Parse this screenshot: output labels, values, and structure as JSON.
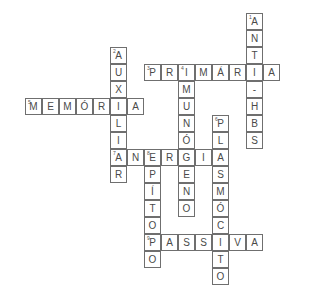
{
  "puzzle": {
    "type": "crossword",
    "cell_size_px": 17,
    "origin_px": [
      25,
      13
    ],
    "colors": {
      "border": "#6f6f6f",
      "letter": "#4a4a4a",
      "background": "#ffffff"
    },
    "words": [
      {
        "number": 1,
        "answer": "ANTI-HBS",
        "direction": "down",
        "row": 0,
        "col": 13
      },
      {
        "number": 2,
        "answer": "AUXILIAR",
        "direction": "down",
        "row": 2,
        "col": 5
      },
      {
        "number": 3,
        "answer": "PRIMÁRIA",
        "direction": "across",
        "row": 3,
        "col": 7
      },
      {
        "number": 4,
        "answer": "IMUNÓGENO",
        "direction": "down",
        "row": 3,
        "col": 9
      },
      {
        "number": 5,
        "answer": "MEMÓRIA",
        "direction": "across",
        "row": 5,
        "col": 0
      },
      {
        "number": 6,
        "answer": "PLASMÓCITO",
        "direction": "down",
        "row": 6,
        "col": 11
      },
      {
        "number": 7,
        "answer": "ANERGIA",
        "direction": "across",
        "row": 8,
        "col": 5
      },
      {
        "number": 8,
        "answer": "EPÍTOPO",
        "direction": "down",
        "row": 8,
        "col": 7
      },
      {
        "number": 9,
        "answer": "PASSIVA",
        "direction": "across",
        "row": 13,
        "col": 7
      }
    ]
  }
}
